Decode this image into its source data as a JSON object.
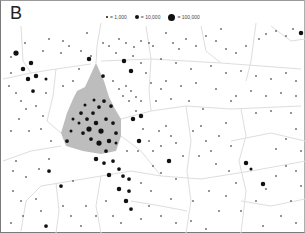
{
  "panel": {
    "label": "B"
  },
  "legend": {
    "items": [
      {
        "label": "= 1,000",
        "size": 2
      },
      {
        "label": "= 10,000",
        "size": 4
      },
      {
        "label": "= 100,000",
        "size": 7
      }
    ]
  },
  "colors": {
    "dot": "#111111",
    "boundary": "#dedede",
    "shaded_region": "#bdbdbd",
    "background": "#ffffff",
    "frame": "#7a7a7a"
  },
  "map": {
    "type": "dot-density population map",
    "shaded_region": [
      [
        76,
        90
      ],
      [
        84,
        86
      ],
      [
        95,
        62
      ],
      [
        103,
        80
      ],
      [
        108,
        96
      ],
      [
        114,
        108
      ],
      [
        120,
        118
      ],
      [
        120,
        135
      ],
      [
        115,
        150
      ],
      [
        100,
        153
      ],
      [
        82,
        150
      ],
      [
        65,
        145
      ],
      [
        60,
        132
      ],
      [
        66,
        112
      ],
      [
        72,
        98
      ]
    ],
    "boundaries": [
      [
        [
          2,
          78
        ],
        [
          30,
          72
        ],
        [
          55,
          68
        ],
        [
          90,
          63
        ]
      ],
      [
        [
          2,
          160
        ],
        [
          30,
          150
        ],
        [
          60,
          145
        ]
      ],
      [
        [
          55,
          68
        ],
        [
          52,
          95
        ],
        [
          46,
          120
        ],
        [
          60,
          132
        ]
      ],
      [
        [
          100,
          22
        ],
        [
          96,
          45
        ],
        [
          95,
          62
        ]
      ],
      [
        [
          20,
          25
        ],
        [
          22,
          60
        ],
        [
          30,
          72
        ]
      ],
      [
        [
          100,
          60
        ],
        [
          150,
          58
        ],
        [
          220,
          62
        ],
        [
          300,
          68
        ]
      ],
      [
        [
          145,
          25
        ],
        [
          150,
          58
        ],
        [
          148,
          90
        ],
        [
          150,
          110
        ]
      ],
      [
        [
          200,
          25
        ],
        [
          205,
          50
        ],
        [
          220,
          62
        ]
      ],
      [
        [
          255,
          22
        ],
        [
          250,
          60
        ],
        [
          245,
          80
        ]
      ],
      [
        [
          120,
          118
        ],
        [
          150,
          110
        ],
        [
          185,
          105
        ],
        [
          230,
          108
        ],
        [
          300,
          105
        ]
      ],
      [
        [
          185,
          105
        ],
        [
          190,
          140
        ],
        [
          186,
          170
        ],
        [
          190,
          200
        ],
        [
          185,
          232
        ]
      ],
      [
        [
          240,
          108
        ],
        [
          245,
          135
        ],
        [
          238,
          160
        ],
        [
          245,
          190
        ],
        [
          240,
          232
        ]
      ],
      [
        [
          120,
          135
        ],
        [
          140,
          150
        ],
        [
          160,
          175
        ],
        [
          200,
          178
        ],
        [
          250,
          170
        ],
        [
          305,
          160
        ]
      ],
      [
        [
          20,
          230
        ],
        [
          25,
          200
        ],
        [
          40,
          185
        ],
        [
          70,
          180
        ],
        [
          100,
          175
        ],
        [
          130,
          170
        ],
        [
          160,
          175
        ]
      ],
      [
        [
          100,
          175
        ],
        [
          95,
          205
        ],
        [
          100,
          232
        ]
      ],
      [
        [
          55,
          182
        ],
        [
          58,
          210
        ],
        [
          55,
          232
        ]
      ],
      [
        [
          270,
          25
        ],
        [
          290,
          40
        ],
        [
          304,
          38
        ]
      ],
      [
        [
          230,
          140
        ],
        [
          270,
          132
        ],
        [
          304,
          140
        ]
      ],
      [
        [
          130,
          200
        ],
        [
          160,
          205
        ],
        [
          186,
          210
        ]
      ],
      [
        [
          240,
          200
        ],
        [
          270,
          205
        ],
        [
          304,
          198
        ]
      ]
    ],
    "dots": [
      [
        15,
        52,
        3.5
      ],
      [
        22,
        68,
        3
      ],
      [
        30,
        62,
        3
      ],
      [
        27,
        78,
        3
      ],
      [
        35,
        75,
        3
      ],
      [
        32,
        90,
        2.5
      ],
      [
        45,
        78,
        2
      ],
      [
        24,
        42,
        1
      ],
      [
        48,
        38,
        1
      ],
      [
        62,
        40,
        1
      ],
      [
        68,
        45,
        1
      ],
      [
        80,
        50,
        1
      ],
      [
        86,
        32,
        1
      ],
      [
        102,
        42,
        1
      ],
      [
        108,
        45,
        1
      ],
      [
        118,
        38,
        1
      ],
      [
        125,
        42,
        1
      ],
      [
        133,
        46,
        1
      ],
      [
        140,
        40,
        1
      ],
      [
        148,
        42,
        1
      ],
      [
        152,
        45,
        1
      ],
      [
        10,
        56,
        1
      ],
      [
        42,
        50,
        1
      ],
      [
        60,
        52,
        1
      ],
      [
        90,
        55,
        1
      ],
      [
        115,
        52,
        1
      ],
      [
        132,
        55,
        1
      ],
      [
        10,
        72,
        1
      ],
      [
        45,
        92,
        1
      ],
      [
        62,
        85,
        1
      ],
      [
        72,
        80,
        1
      ],
      [
        78,
        68,
        1
      ],
      [
        88,
        58,
        3
      ],
      [
        102,
        75,
        2.5
      ],
      [
        112,
        80,
        1
      ],
      [
        118,
        88,
        1
      ],
      [
        125,
        85,
        1
      ],
      [
        130,
        90,
        1
      ],
      [
        135,
        96,
        1
      ],
      [
        140,
        100,
        1
      ],
      [
        8,
        85,
        1
      ],
      [
        15,
        92,
        1
      ],
      [
        20,
        100,
        1
      ],
      [
        25,
        108,
        1
      ],
      [
        35,
        105,
        1
      ],
      [
        42,
        115,
        1
      ],
      [
        18,
        118,
        1
      ],
      [
        10,
        130,
        1
      ],
      [
        28,
        130,
        1
      ],
      [
        40,
        128,
        1
      ],
      [
        50,
        140,
        1
      ],
      [
        48,
        158,
        1
      ],
      [
        15,
        160,
        1
      ],
      [
        12,
        170,
        1
      ],
      [
        25,
        176,
        1
      ],
      [
        38,
        168,
        1
      ],
      [
        123,
        60,
        3
      ],
      [
        130,
        70,
        3
      ],
      [
        122,
        95,
        1
      ],
      [
        128,
        100,
        1
      ],
      [
        135,
        110,
        1
      ],
      [
        140,
        115,
        3
      ],
      [
        132,
        118,
        3
      ],
      [
        142,
        128,
        1
      ],
      [
        138,
        140,
        3
      ],
      [
        126,
        150,
        1
      ],
      [
        137,
        150,
        1
      ],
      [
        80,
        112,
        2.5
      ],
      [
        86,
        118,
        2.5
      ],
      [
        92,
        112,
        2.5
      ],
      [
        98,
        106,
        2.5
      ],
      [
        103,
        100,
        2.5
      ],
      [
        110,
        105,
        2.5
      ],
      [
        95,
        122,
        3
      ],
      [
        88,
        128,
        3.5
      ],
      [
        100,
        130,
        3.5
      ],
      [
        105,
        118,
        2.5
      ],
      [
        112,
        122,
        2.5
      ],
      [
        115,
        132,
        2.5
      ],
      [
        108,
        140,
        3
      ],
      [
        98,
        142,
        3.5
      ],
      [
        90,
        138,
        2.5
      ],
      [
        82,
        132,
        2.5
      ],
      [
        78,
        122,
        2
      ],
      [
        72,
        118,
        2
      ],
      [
        70,
        130,
        2
      ],
      [
        66,
        140,
        2.5
      ],
      [
        105,
        150,
        2.5
      ],
      [
        115,
        142,
        2
      ],
      [
        93,
        99,
        2
      ],
      [
        84,
        104,
        2
      ],
      [
        95,
        158,
        3
      ],
      [
        103,
        162,
        2.5
      ],
      [
        112,
        160,
        2.5
      ],
      [
        118,
        168,
        2.5
      ],
      [
        108,
        174,
        3
      ],
      [
        122,
        175,
        2.5
      ],
      [
        128,
        178,
        2.5
      ],
      [
        118,
        188,
        3
      ],
      [
        128,
        190,
        2.5
      ],
      [
        125,
        200,
        3
      ],
      [
        130,
        208,
        2.5
      ],
      [
        48,
        170,
        2.5
      ],
      [
        60,
        185,
        2.5
      ],
      [
        72,
        180,
        1
      ],
      [
        158,
        130,
        1
      ],
      [
        165,
        125,
        1
      ],
      [
        170,
        135,
        1
      ],
      [
        160,
        145,
        1
      ],
      [
        175,
        142,
        1
      ],
      [
        168,
        160,
        3
      ],
      [
        182,
        155,
        1
      ],
      [
        160,
        172,
        1
      ],
      [
        175,
        178,
        1
      ],
      [
        192,
        130,
        1
      ],
      [
        200,
        125,
        1
      ],
      [
        205,
        140,
        1
      ],
      [
        198,
        155,
        1
      ],
      [
        210,
        150,
        1
      ],
      [
        218,
        135,
        1
      ],
      [
        225,
        122,
        1
      ],
      [
        230,
        145,
        1
      ],
      [
        215,
        163,
        1
      ],
      [
        228,
        170,
        1
      ],
      [
        235,
        182,
        1
      ],
      [
        225,
        195,
        1
      ],
      [
        208,
        190,
        1
      ],
      [
        192,
        200,
        1
      ],
      [
        170,
        198,
        1
      ],
      [
        160,
        215,
        1
      ],
      [
        175,
        222,
        1
      ],
      [
        190,
        220,
        1
      ],
      [
        205,
        228,
        1
      ],
      [
        218,
        210,
        1
      ],
      [
        240,
        210,
        1
      ],
      [
        255,
        200,
        1
      ],
      [
        265,
        188,
        1
      ],
      [
        275,
        175,
        1
      ],
      [
        285,
        165,
        1
      ],
      [
        295,
        170,
        1
      ],
      [
        300,
        185,
        1
      ],
      [
        290,
        200,
        1
      ],
      [
        280,
        215,
        1
      ],
      [
        295,
        222,
        1
      ],
      [
        262,
        225,
        1
      ],
      [
        165,
        32,
        1
      ],
      [
        172,
        42,
        1
      ],
      [
        178,
        48,
        1
      ],
      [
        185,
        38,
        1
      ],
      [
        195,
        45,
        1
      ],
      [
        205,
        35,
        1
      ],
      [
        215,
        40,
        1
      ],
      [
        220,
        28,
        1
      ],
      [
        225,
        48,
        1
      ],
      [
        235,
        52,
        1
      ],
      [
        245,
        45,
        1
      ],
      [
        258,
        38,
        1
      ],
      [
        265,
        33,
        1
      ],
      [
        275,
        30,
        1
      ],
      [
        285,
        35,
        1
      ],
      [
        292,
        28,
        1
      ],
      [
        300,
        32,
        3
      ],
      [
        160,
        58,
        1
      ],
      [
        175,
        62,
        1
      ],
      [
        190,
        68,
        1
      ],
      [
        210,
        65,
        1
      ],
      [
        225,
        72,
        1
      ],
      [
        240,
        70,
        1
      ],
      [
        255,
        75,
        1
      ],
      [
        270,
        78,
        1
      ],
      [
        285,
        72,
        1
      ],
      [
        295,
        80,
        1
      ],
      [
        165,
        80,
        1
      ],
      [
        180,
        85,
        1
      ],
      [
        195,
        82,
        1
      ],
      [
        215,
        88,
        1
      ],
      [
        235,
        95,
        1
      ],
      [
        250,
        90,
        1
      ],
      [
        265,
        95,
        1
      ],
      [
        280,
        92,
        1
      ],
      [
        295,
        95,
        1
      ],
      [
        170,
        98,
        1
      ],
      [
        188,
        100,
        1
      ],
      [
        202,
        108,
        1
      ],
      [
        245,
        162,
        3
      ],
      [
        250,
        168,
        2
      ],
      [
        262,
        183,
        3
      ],
      [
        275,
        148,
        1
      ],
      [
        285,
        138,
        1
      ],
      [
        295,
        128,
        1
      ],
      [
        300,
        150,
        1
      ],
      [
        230,
        100,
        1
      ],
      [
        255,
        112,
        1
      ],
      [
        270,
        110,
        1
      ],
      [
        290,
        112,
        1
      ],
      [
        12,
        190,
        1
      ],
      [
        20,
        200,
        1
      ],
      [
        35,
        198,
        1
      ],
      [
        40,
        210,
        1
      ],
      [
        22,
        215,
        1
      ],
      [
        10,
        222,
        1
      ],
      [
        45,
        225,
        2.5
      ],
      [
        62,
        205,
        1
      ],
      [
        70,
        215,
        1
      ],
      [
        80,
        225,
        1
      ],
      [
        85,
        205,
        1
      ],
      [
        95,
        215,
        1
      ],
      [
        105,
        200,
        1
      ],
      [
        112,
        215,
        1
      ],
      [
        120,
        222,
        1
      ],
      [
        140,
        218,
        1
      ],
      [
        148,
        205,
        1
      ],
      [
        150,
        190,
        1
      ],
      [
        140,
        182,
        1
      ],
      [
        152,
        165,
        1
      ],
      [
        152,
        150,
        1
      ],
      [
        148,
        140,
        1
      ],
      [
        155,
        100,
        1
      ],
      [
        160,
        88,
        1
      ],
      [
        145,
        72,
        1
      ],
      [
        140,
        62,
        1
      ],
      [
        150,
        82,
        1
      ]
    ]
  }
}
